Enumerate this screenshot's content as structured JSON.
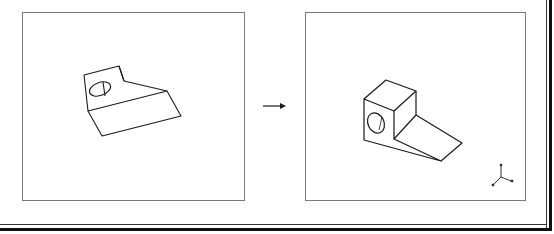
{
  "diagram": {
    "type": "cad-view-transformation",
    "panels": [
      {
        "id": "before",
        "description": "3D part in arbitrary orientation with circular hole",
        "shape": "block-with-ramp-and-hole"
      },
      {
        "id": "after",
        "description": "Same 3D part reoriented to isometric view with axis triad",
        "shape": "block-with-ramp-and-hole",
        "triad": {
          "labels": [
            "y",
            "x",
            "z"
          ]
        }
      }
    ],
    "connector": {
      "type": "arrow",
      "direction": "right"
    }
  },
  "colors": {
    "line": "#1a1a1a",
    "panel_border": "#7a7a7a",
    "background": "#ffffff",
    "frame": "#111111"
  }
}
